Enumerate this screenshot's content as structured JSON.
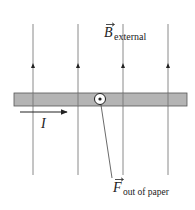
{
  "diagram": {
    "field": {
      "symbol": "B",
      "subscript": "external",
      "direction": "up",
      "line_count": 4
    },
    "wire": {
      "current_symbol": "I",
      "current_direction": "right"
    },
    "force": {
      "symbol": "F",
      "subscript": "out of paper",
      "marker": "dot-in-circle"
    },
    "colors": {
      "field_line": "#8a8a8a",
      "wire_fill": "#b4b4b4",
      "wire_edge": "#555555",
      "arrow": "#222222",
      "text": "#222222"
    }
  }
}
